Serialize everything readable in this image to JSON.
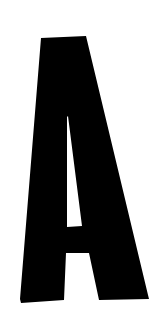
{
  "image": {
    "width": 163,
    "height": 318,
    "background_color": "#ffffff"
  },
  "glyph": {
    "character": "A",
    "color": "#000000",
    "style": "condensed bold sans-serif, slightly skewed, hand-cut look"
  }
}
